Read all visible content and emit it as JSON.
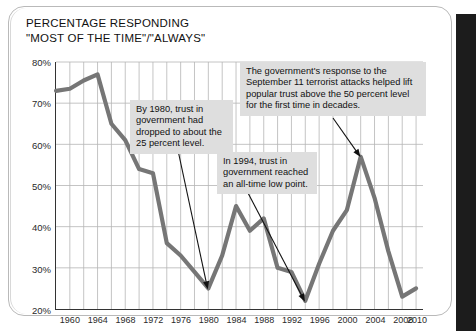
{
  "chart_data": {
    "type": "line",
    "title": "PERCENTAGE RESPONDING\n\"MOST OF THE TIME\"/\"ALWAYS\"",
    "xlabel": "",
    "ylabel": "",
    "xlim": [
      1958,
      2011
    ],
    "ylim": [
      20,
      80
    ],
    "grid": true,
    "legend": "none",
    "y_ticks": [
      "20%",
      "30%",
      "40%",
      "50%",
      "60%",
      "70%",
      "80%"
    ],
    "y_tick_values": [
      20,
      30,
      40,
      50,
      60,
      70,
      80
    ],
    "x_ticks": [
      "1960",
      "1964",
      "1968",
      "1972",
      "1976",
      "1980",
      "1984",
      "1988",
      "1992",
      "1996",
      "2000",
      "2004",
      "2008",
      "2010"
    ],
    "x_tick_values": [
      1960,
      1964,
      1968,
      1972,
      1976,
      1980,
      1984,
      1988,
      1992,
      1996,
      2000,
      2004,
      2008,
      2010
    ],
    "x_gridline_values": [
      1960,
      1962,
      1964,
      1966,
      1968,
      1970,
      1972,
      1974,
      1976,
      1978,
      1980,
      1982,
      1984,
      1986,
      1988,
      1990,
      1992,
      1994,
      1996,
      1998,
      2000,
      2002,
      2004,
      2006,
      2008,
      2010
    ],
    "series": [
      {
        "name": "Trust in government",
        "color": "#767676",
        "x": [
          1958,
          1960,
          1962,
          1964,
          1966,
          1968,
          1970,
          1972,
          1974,
          1976,
          1978,
          1980,
          1982,
          1984,
          1986,
          1988,
          1990,
          1992,
          1994,
          1996,
          1998,
          2000,
          2002,
          2004,
          2006,
          2008,
          2010
        ],
        "values": [
          73,
          73.5,
          75.5,
          77,
          65,
          61,
          54,
          53,
          36,
          33,
          29,
          25,
          33,
          45,
          39,
          42,
          30,
          29,
          22,
          31,
          39,
          44,
          57,
          47,
          34,
          23,
          25
        ]
      }
    ],
    "annotations": [
      {
        "id": "sept11",
        "text": "The government's response to the September 11 terrorist attacks helped lift popular trust above the 50 percent level for the first time in decades.",
        "points_to_year": 2002,
        "points_to_value": 57
      },
      {
        "id": "by1980",
        "text": "By 1980, trust in government had dropped to about the 25 percent level.",
        "points_to_year": 1980,
        "points_to_value": 25
      },
      {
        "id": "in1994",
        "text": "In 1994, trust in government reached an all-time low point.",
        "points_to_year": 1994,
        "points_to_value": 22
      }
    ]
  }
}
